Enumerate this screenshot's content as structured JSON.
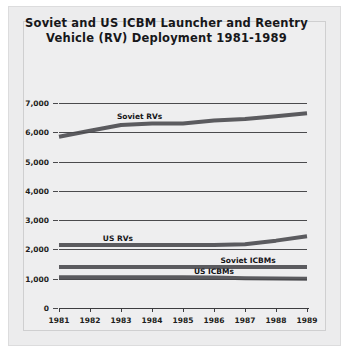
{
  "chart_data": {
    "type": "line",
    "title": "Soviet and US ICBM Launcher and Reentry Vehicle (RV) Deployment 1981-1989",
    "title_line1": "Soviet and US ICBM Launcher and Reentry",
    "title_line2": "Vehicle (RV) Deployment 1981-1989",
    "xlabel": "",
    "ylabel": "",
    "x": [
      1981,
      1982,
      1983,
      1984,
      1985,
      1986,
      1987,
      1988,
      1989
    ],
    "categories": [
      "1981",
      "1982",
      "1983",
      "1984",
      "1985",
      "1986",
      "1987",
      "1988",
      "1989"
    ],
    "ylim": [
      0,
      7000
    ],
    "yticks": [
      0,
      1000,
      2000,
      3000,
      4000,
      5000,
      6000,
      7000
    ],
    "ytick_labels": [
      "0",
      "1,000",
      "2,000",
      "3,000",
      "4,000",
      "5,000",
      "6,000",
      "7,000"
    ],
    "grid": true,
    "legend": "inline-labels",
    "line_color": "#5b5b5f",
    "series": [
      {
        "name": "Soviet RVs",
        "values": [
          5850,
          6050,
          6250,
          6300,
          6300,
          6400,
          6450,
          6550,
          6650
        ]
      },
      {
        "name": "US RVs",
        "values": [
          2150,
          2150,
          2150,
          2150,
          2150,
          2150,
          2180,
          2300,
          2450
        ]
      },
      {
        "name": "Soviet ICBMs",
        "values": [
          1400,
          1400,
          1400,
          1400,
          1400,
          1400,
          1400,
          1400,
          1400
        ]
      },
      {
        "name": "US ICBMs",
        "values": [
          1050,
          1050,
          1050,
          1050,
          1050,
          1040,
          1020,
          1010,
          1000
        ]
      }
    ],
    "annotations": [
      {
        "text": "Soviet RVs",
        "series": "Soviet RVs"
      },
      {
        "text": "US RVs",
        "series": "US RVs"
      },
      {
        "text": "Soviet ICBMs",
        "series": "Soviet ICBMs"
      },
      {
        "text": "US ICBMs",
        "series": "US ICBMs"
      }
    ]
  }
}
